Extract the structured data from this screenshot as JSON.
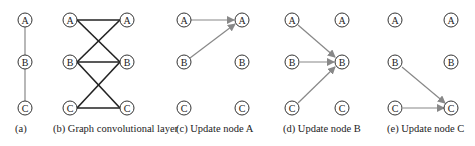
{
  "panels": [
    {
      "id": "a",
      "caption": "(a)"
    },
    {
      "id": "b",
      "caption": "(b) Graph convolutional layer"
    },
    {
      "id": "c",
      "caption": "(c) Update node A"
    },
    {
      "id": "d",
      "caption": "(d) Update node B"
    },
    {
      "id": "e",
      "caption": "(e) Update node C"
    }
  ],
  "node_labels": {
    "A": "A",
    "B": "B",
    "C": "C"
  },
  "colors": {
    "edge_dark": "#222222",
    "edge_gray": "#888888",
    "node_stroke": "#333333"
  }
}
